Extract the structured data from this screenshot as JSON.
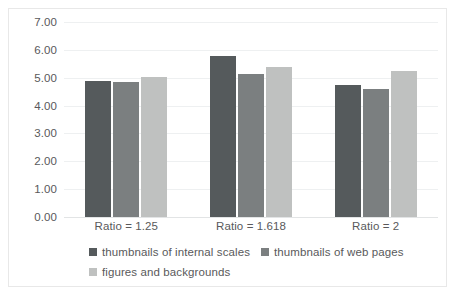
{
  "chart_data": {
    "type": "bar",
    "title": "",
    "xlabel": "",
    "ylabel": "",
    "categories": [
      "Ratio = 1.25",
      "Ratio = 1.618",
      "Ratio = 2"
    ],
    "series": [
      {
        "name": "thumbnails of internal scales",
        "color": "#555a5c",
        "values": [
          4.9,
          5.78,
          4.75
        ]
      },
      {
        "name": "thumbnails of web pages",
        "color": "#7b7f80",
        "values": [
          4.85,
          5.13,
          4.58
        ]
      },
      {
        "name": "figures and backgrounds",
        "color": "#bfc1c0",
        "values": [
          5.02,
          5.38,
          5.25
        ]
      }
    ],
    "ylim": [
      0,
      7
    ],
    "yticks": [
      0,
      1,
      2,
      3,
      4,
      5,
      6,
      7
    ],
    "ytick_labels": [
      "0.00",
      "1.00",
      "2.00",
      "3.00",
      "4.00",
      "5.00",
      "6.00",
      "7.00"
    ],
    "grid": true,
    "legend_position": "bottom",
    "axis_label_color": "#59595b",
    "gridline_color": "#eef0f1",
    "border_color": "#e8e8e8",
    "background": "#ffffff"
  }
}
